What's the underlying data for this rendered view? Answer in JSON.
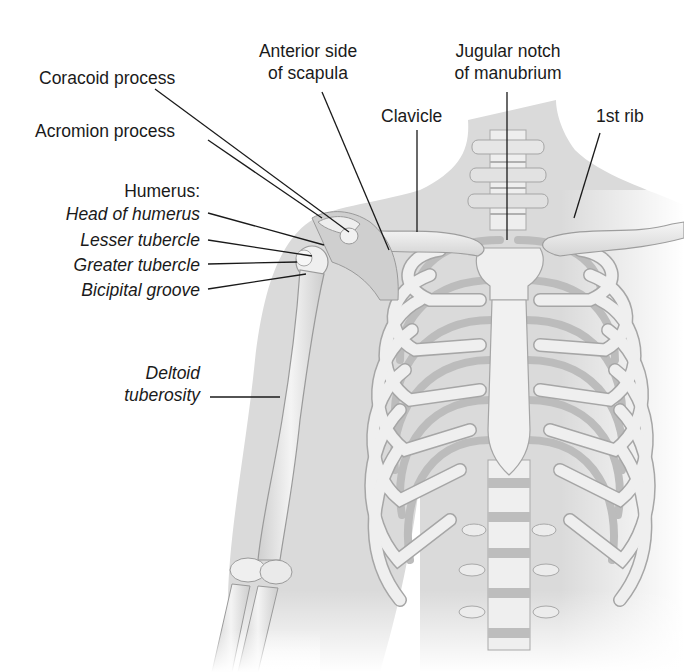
{
  "figure": {
    "title_partial": "",
    "colors": {
      "background": "#ffffff",
      "skin": "#d9d9d9",
      "bone_light": "#f2f2f2",
      "bone_mid": "#dcdcdc",
      "bone_shadow": "#a9a9a9",
      "leader_line": "#1a1a1a",
      "text": "#1a1a1a"
    }
  },
  "labels": {
    "coracoid_process": "Coracoid process",
    "anterior_scapula_1": "Anterior side",
    "anterior_scapula_2": "of scapula",
    "jugular_notch_1": "Jugular notch",
    "jugular_notch_2": "of manubrium",
    "clavicle": "Clavicle",
    "first_rib": "1st rib",
    "acromion_process": "Acromion process",
    "humerus_heading": "Humerus:",
    "head_of_humerus": "Head of humerus",
    "lesser_tubercle": "Lesser tubercle",
    "greater_tubercle": "Greater tubercle",
    "bicipital_groove": "Bicipital groove",
    "deltoid_1": "Deltoid",
    "deltoid_2": "tuberosity"
  },
  "leader_lines": [
    {
      "name": "coracoid-process-leader",
      "x1": 155,
      "y1": 89,
      "x2": 349,
      "y2": 232
    },
    {
      "name": "acromion-process-leader",
      "x1": 208,
      "y1": 140,
      "x2": 322,
      "y2": 218
    },
    {
      "name": "anterior-scapula-leader",
      "x1": 322,
      "y1": 92,
      "x2": 389,
      "y2": 250
    },
    {
      "name": "jugular-notch-leader",
      "x1": 507,
      "y1": 92,
      "x2": 507,
      "y2": 240
    },
    {
      "name": "clavicle-leader",
      "x1": 417,
      "y1": 130,
      "x2": 417,
      "y2": 232
    },
    {
      "name": "first-rib-leader",
      "x1": 600,
      "y1": 133,
      "x2": 574,
      "y2": 218
    },
    {
      "name": "head-of-humerus-leader",
      "x1": 208,
      "y1": 213,
      "x2": 324,
      "y2": 245
    },
    {
      "name": "lesser-tubercle-leader",
      "x1": 208,
      "y1": 240,
      "x2": 312,
      "y2": 256
    },
    {
      "name": "greater-tubercle-leader",
      "x1": 208,
      "y1": 264,
      "x2": 297,
      "y2": 262
    },
    {
      "name": "bicipital-groove-leader",
      "x1": 208,
      "y1": 289,
      "x2": 306,
      "y2": 274
    },
    {
      "name": "deltoid-tuberosity-leader",
      "x1": 210,
      "y1": 397,
      "x2": 280,
      "y2": 397
    }
  ]
}
